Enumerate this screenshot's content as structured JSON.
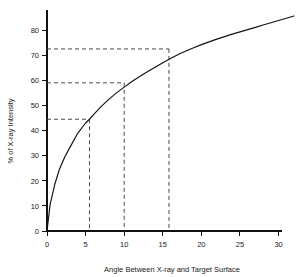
{
  "chart_data": {
    "type": "line",
    "title": "",
    "xlabel": "Angle Between X-ray and Target Surface",
    "ylabel": "% of X-ray Intensity",
    "xlim": [
      0,
      32
    ],
    "ylim": [
      0,
      88
    ],
    "grid": false,
    "legend": null,
    "xticks": [
      0,
      5,
      10,
      15,
      20,
      25,
      30
    ],
    "xticklabels": [
      "0",
      "5",
      "10",
      "15",
      "20",
      "25",
      "30"
    ],
    "yticks": [
      0,
      10,
      20,
      30,
      40,
      50,
      60,
      70,
      80
    ],
    "yticklabels": [
      "0",
      "10",
      "20",
      "30",
      "40",
      "50",
      "60",
      "70",
      "80"
    ],
    "series": [
      {
        "name": "X-ray intensity vs angle",
        "x": [
          0,
          0.4,
          1,
          1.6,
          2.3,
          3,
          4,
          5,
          5.5,
          6,
          7,
          8,
          9,
          10,
          11,
          12,
          13,
          14,
          15,
          16,
          17,
          18,
          19,
          20,
          21,
          22,
          23,
          24,
          25,
          26,
          27,
          28,
          29,
          30,
          31,
          32
        ],
        "y": [
          0,
          10.5,
          18.5,
          24.5,
          29.5,
          33.5,
          39.0,
          43.0,
          44.5,
          46.2,
          49.5,
          52.4,
          55.0,
          57.3,
          59.5,
          61.5,
          63.4,
          65.2,
          67.0,
          68.7,
          70.3,
          71.7,
          73.0,
          74.2,
          75.3,
          76.4,
          77.4,
          78.4,
          79.3,
          80.2,
          81.1,
          82.0,
          82.9,
          83.8,
          84.7,
          85.6
        ]
      }
    ],
    "annotations": [
      {
        "name": "guide-low",
        "x": 5.5,
        "y": 44.5,
        "style": "dashed"
      },
      {
        "name": "guide-mid",
        "x": 10.0,
        "y": 59.0,
        "style": "dashed"
      },
      {
        "name": "guide-high",
        "x": 15.8,
        "y": 72.5,
        "style": "dashed"
      }
    ]
  }
}
